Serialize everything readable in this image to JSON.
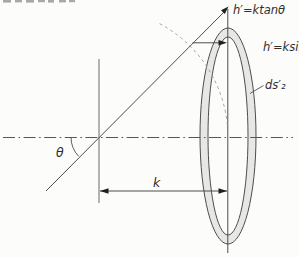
{
  "figure": {
    "type": "optics-aperture-diagram",
    "labels": {
      "tangent_height": "h′=ktanθ",
      "sine_height": "h′=ksinθ",
      "surface_element": "ds′₂",
      "distance": "k",
      "angle": "θ"
    },
    "colors": {
      "background": "#fcfcfa",
      "line": "#4d4d4d",
      "light_line": "#6a6a6a",
      "dashed_line": "#979797",
      "ring_fill": "#e7e7e4",
      "arrow_fill": "#1f1f1f"
    }
  }
}
